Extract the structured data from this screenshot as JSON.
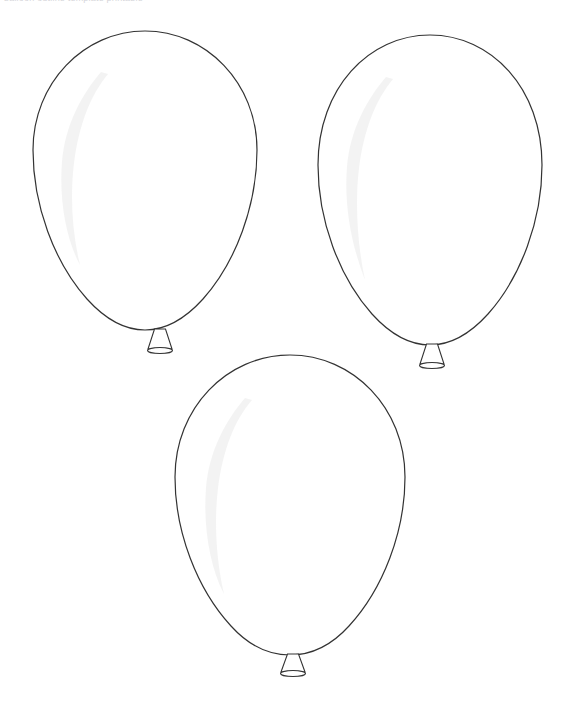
{
  "page": {
    "width": 572,
    "height": 710,
    "background_color": "#ffffff",
    "kind": "line-art-coloring-page"
  },
  "top_caption": {
    "text": "balloon outline template printable",
    "note": "faint light-grey text clipped by the top edge of the image, only the lower 1-2 pixels of the glyphs are visible",
    "color": "#d6d6da"
  },
  "style": {
    "outline_color": "#333333",
    "outline_width": 1.2,
    "fill_color": "#ffffff",
    "highlight_color": "#f2f2f2",
    "highlight_opacity": 0.9
  },
  "balloons": [
    {
      "id": "balloon-1",
      "label": "Balloon 1 (top left)",
      "center_x": 145,
      "center_y": 180,
      "radius_x": 112,
      "radius_y": 150,
      "bounds": {
        "left": 33,
        "top": 31,
        "right": 257,
        "bottom": 330
      },
      "neck": {
        "center_x": 160,
        "top_y": 329,
        "bottom_y": 353,
        "top_width": 11,
        "bottom_width": 25
      },
      "highlight": true,
      "filled": false
    },
    {
      "id": "balloon-2",
      "label": "Balloon 2 (top right)",
      "center_x": 430,
      "center_y": 194,
      "radius_x": 112,
      "radius_y": 150,
      "bounds": {
        "left": 318,
        "top": 35,
        "right": 542,
        "bottom": 345
      },
      "neck": {
        "center_x": 432,
        "top_y": 344,
        "bottom_y": 368,
        "top_width": 11,
        "bottom_width": 25
      },
      "highlight": true,
      "filled": false
    },
    {
      "id": "balloon-3",
      "label": "Balloon 3 (bottom center)",
      "center_x": 290,
      "center_y": 505,
      "radius_x": 115,
      "radius_y": 150,
      "bounds": {
        "left": 175,
        "top": 355,
        "right": 405,
        "bottom": 655
      },
      "neck": {
        "center_x": 293,
        "top_y": 654,
        "bottom_y": 676,
        "top_width": 11,
        "bottom_width": 25
      },
      "highlight": true,
      "filled": false
    }
  ]
}
